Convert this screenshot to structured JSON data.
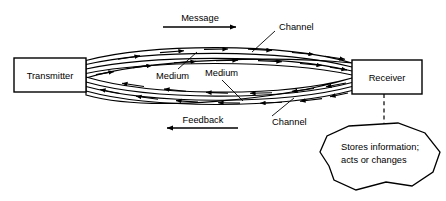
{
  "diagram": {
    "background_color": "#ffffff",
    "line_color": "#000000",
    "nodes": {
      "transmitter": {
        "label": "Transmitter"
      },
      "receiver": {
        "label": "Receiver"
      },
      "memory_blob": {
        "line1": "Stores information;",
        "line2": "acts or changes"
      }
    },
    "flow_labels": {
      "message": "Message",
      "feedback": "Feedback"
    },
    "annotations": {
      "channel_top": "Channel",
      "channel_bottom": "Channel",
      "medium_left": "Medium",
      "medium_right": "Medium"
    }
  }
}
